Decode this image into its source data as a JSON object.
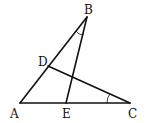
{
  "diagram": {
    "type": "geometry-triangle",
    "points": {
      "A": {
        "label": "A",
        "x": 20,
        "y": 103
      },
      "B": {
        "label": "B",
        "x": 87,
        "y": 17
      },
      "C": {
        "label": "C",
        "x": 130,
        "y": 103
      },
      "D": {
        "label": "D",
        "x": 48,
        "y": 66
      },
      "E": {
        "label": "E",
        "x": 66,
        "y": 103
      }
    },
    "segments": [
      "AB",
      "BC_none",
      "AC",
      "BE",
      "CD"
    ],
    "angle_marks": [
      {
        "vertex": "B",
        "between": [
          "BA",
          "BE"
        ]
      },
      {
        "vertex": "C",
        "between": [
          "CA",
          "CD"
        ]
      }
    ],
    "stroke_color": "#111111",
    "background": "#ffffff"
  }
}
